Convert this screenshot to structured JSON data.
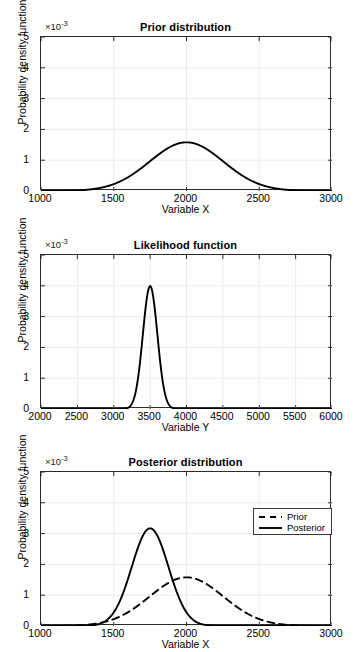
{
  "figure": {
    "background": "#ffffff",
    "curve_color": "#000000",
    "axis_color": "#2b2b2b",
    "grid_color": "#ebebeb"
  },
  "panels": [
    {
      "id": "prior",
      "title": "Prior distribution",
      "exponent_prefix": "×10",
      "exponent_power": "-3",
      "xlabel": "Variable X",
      "ylabel": "Probability density function",
      "xticks": [
        "1000",
        "1500",
        "2000",
        "2500",
        "3000"
      ],
      "yticks": [
        "0",
        "1",
        "2",
        "3",
        "4",
        "5"
      ]
    },
    {
      "id": "likelihood",
      "title": "Likelihood function",
      "exponent_prefix": "×10",
      "exponent_power": "-3",
      "xlabel": "Variable Y",
      "ylabel": "Probability density function",
      "xticks": [
        "2000",
        "2500",
        "3000",
        "3500",
        "4000",
        "4500",
        "5000",
        "5500",
        "6000"
      ],
      "yticks": [
        "0",
        "1",
        "2",
        "3",
        "4",
        "5"
      ]
    },
    {
      "id": "posterior",
      "title": "Posterior distribution",
      "exponent_prefix": "×10",
      "exponent_power": "-3",
      "xlabel": "Variable X",
      "ylabel": "Probability density function",
      "xticks": [
        "1000",
        "1500",
        "2000",
        "2500",
        "3000"
      ],
      "yticks": [
        "0",
        "1",
        "2",
        "3",
        "4",
        "5"
      ],
      "legend": [
        {
          "label": "Prior",
          "style": "dashed"
        },
        {
          "label": "Posterior",
          "style": "solid"
        }
      ]
    }
  ],
  "chart_data": [
    {
      "type": "line",
      "id": "prior",
      "title": "Prior distribution",
      "xlabel": "Variable X",
      "ylabel": "Probability density function",
      "y_multiplier": 0.001,
      "xlim": [
        1000,
        3000
      ],
      "ylim": [
        0,
        5
      ],
      "xticks": [
        1000,
        1500,
        2000,
        2500,
        3000
      ],
      "yticks": [
        0,
        1,
        2,
        3,
        4,
        5
      ],
      "grid": true,
      "legend": null,
      "series": [
        {
          "name": "Prior",
          "style": "solid",
          "distribution": "normal",
          "mean": 2000,
          "sigma": 253,
          "peak_value": 1.58,
          "peak_x": 2000
        }
      ]
    },
    {
      "type": "line",
      "id": "likelihood",
      "title": "Likelihood function",
      "xlabel": "Variable Y",
      "ylabel": "Probability density function",
      "y_multiplier": 0.001,
      "xlim": [
        2000,
        6000
      ],
      "ylim": [
        0,
        5
      ],
      "xticks": [
        2000,
        2500,
        3000,
        3500,
        4000,
        4500,
        5000,
        5500,
        6000
      ],
      "yticks": [
        0,
        1,
        2,
        3,
        4,
        5
      ],
      "grid": true,
      "legend": null,
      "series": [
        {
          "name": "Likelihood",
          "style": "solid",
          "distribution": "normal",
          "mean": 3500,
          "sigma": 100,
          "peak_value": 3.99,
          "peak_x": 3500
        }
      ]
    },
    {
      "type": "line",
      "id": "posterior",
      "title": "Posterior distribution",
      "xlabel": "Variable X",
      "ylabel": "Probability density function",
      "y_multiplier": 0.001,
      "xlim": [
        1000,
        3000
      ],
      "ylim": [
        0,
        5
      ],
      "xticks": [
        1000,
        1500,
        2000,
        2500,
        3000
      ],
      "yticks": [
        0,
        1,
        2,
        3,
        4,
        5
      ],
      "grid": true,
      "legend": {
        "position": "top-right",
        "entries": [
          "Prior",
          "Posterior"
        ]
      },
      "series": [
        {
          "name": "Prior",
          "style": "dashed",
          "distribution": "normal",
          "mean": 2000,
          "sigma": 253,
          "peak_value": 1.58,
          "peak_x": 2000
        },
        {
          "name": "Posterior",
          "style": "solid",
          "distribution": "normal",
          "mean": 1750,
          "sigma": 126,
          "peak_value": 3.17,
          "peak_x": 1750
        }
      ]
    }
  ]
}
